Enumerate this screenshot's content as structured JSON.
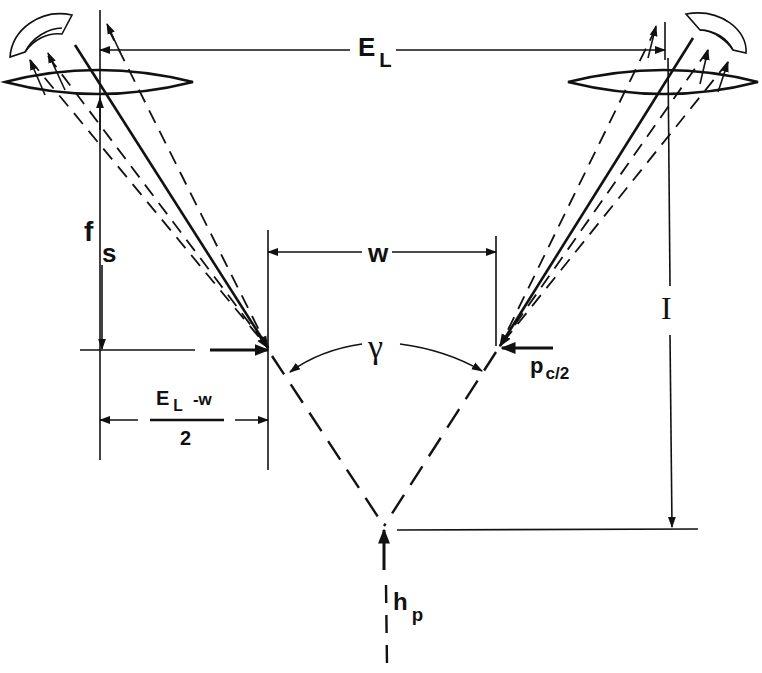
{
  "diagram": {
    "type": "stereoscopic viewing geometry",
    "stroke_color": "#111111",
    "background": "#ffffff",
    "labels": {
      "eye_separation": {
        "main": "E",
        "sub": "L"
      },
      "focal_length": {
        "main": "f",
        "sub": "s"
      },
      "image_width": {
        "main": "w"
      },
      "convergence_angle": {
        "main": "γ"
      },
      "viewing_distance": {
        "main": "I"
      },
      "parallax": {
        "main": "p",
        "sub": "c/2"
      },
      "half_difference": {
        "numerator_main": "E",
        "numerator_sub": "L",
        "numerator_rest": "-w",
        "denominator": "2"
      },
      "depth": {
        "main": "h",
        "sub": "p"
      }
    },
    "elements": [
      "left-eye",
      "right-eye",
      "left-lens",
      "right-lens",
      "left-image-point",
      "right-image-point",
      "fused-point"
    ]
  }
}
